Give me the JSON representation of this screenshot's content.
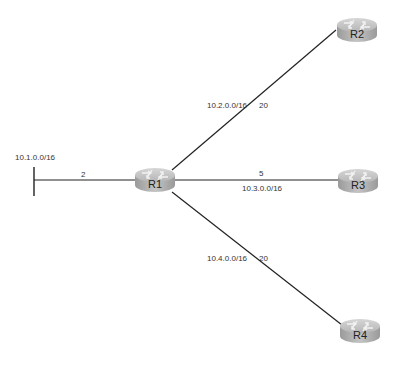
{
  "diagram": {
    "type": "network-topology",
    "routers": [
      {
        "id": "R1",
        "label": "R1"
      },
      {
        "id": "R2",
        "label": "R2"
      },
      {
        "id": "R3",
        "label": "R3"
      },
      {
        "id": "R4",
        "label": "R4"
      }
    ],
    "links": [
      {
        "from": "10.1.0.0/16",
        "to": "R1",
        "network": "10.1.0.0/16",
        "cost": "2"
      },
      {
        "from": "R1",
        "to": "R2",
        "network": "10.2.0.0/16",
        "cost": "20"
      },
      {
        "from": "R1",
        "to": "R3",
        "network": "10.3.0.0/16",
        "cost": "5"
      },
      {
        "from": "R1",
        "to": "R4",
        "network": "10.4.0.0/16",
        "cost": "20"
      }
    ]
  },
  "labels": {
    "net1": "10.1.0.0/16",
    "cost1": "2",
    "net2": "10.2.0.0/16",
    "cost2": "20",
    "net3": "10.3.0.0/16",
    "cost3": "5",
    "net4": "10.4.0.0/16",
    "cost4": "20"
  }
}
